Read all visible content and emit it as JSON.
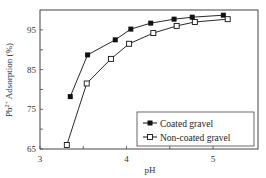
{
  "chart_data": {
    "type": "line",
    "title": "",
    "xlabel": "pH",
    "ylabel": "Pb2+ Adsorption (%)",
    "ylabel_parts": {
      "base": "Pb",
      "sup": "2+",
      "rest": " Adsorption (%)"
    },
    "xlim": [
      3,
      5.3
    ],
    "ylim": [
      65,
      100
    ],
    "xticks": [
      3,
      3.5,
      4,
      4.5,
      5
    ],
    "xtick_labels": [
      "3",
      "",
      "4",
      "",
      "5"
    ],
    "yticks": [
      65,
      70,
      75,
      80,
      85,
      90,
      95
    ],
    "ytick_labels": [
      "65",
      "",
      "75",
      "",
      "85",
      "",
      "95"
    ],
    "grid": false,
    "legend_position": "lower right",
    "series": [
      {
        "name": "Coated gravel",
        "marker": "filled-square",
        "color": "#111111",
        "x": [
          3.35,
          3.55,
          3.87,
          4.05,
          4.28,
          4.55,
          4.76,
          5.12
        ],
        "y": [
          78.2,
          88.7,
          92.5,
          95.2,
          96.7,
          97.7,
          98.2,
          98.7
        ]
      },
      {
        "name": "Non-coated gravel",
        "marker": "open-square",
        "color": "#111111",
        "x": [
          3.31,
          3.54,
          3.82,
          4.03,
          4.31,
          4.58,
          4.79,
          5.17
        ],
        "y": [
          66.0,
          81.5,
          87.7,
          91.5,
          94.2,
          96.0,
          97.0,
          97.7
        ]
      }
    ]
  }
}
